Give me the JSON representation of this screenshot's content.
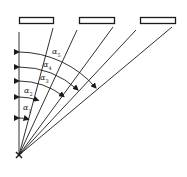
{
  "diagram": {
    "type": "angle-fan",
    "origin_marker": "x",
    "stroke_color": "#1a1a1a",
    "background": "#ffffff",
    "rectangles": 3,
    "labels": [
      {
        "id": "a1",
        "text": "α",
        "sub": "1"
      },
      {
        "id": "a2",
        "text": "α",
        "sub": "2"
      },
      {
        "id": "a3",
        "text": "α",
        "sub": "3"
      },
      {
        "id": "a4",
        "text": "α",
        "sub": "4"
      },
      {
        "id": "a5",
        "text": "α",
        "sub": "5"
      }
    ]
  }
}
